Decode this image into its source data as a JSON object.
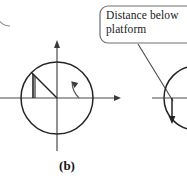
{
  "figure": {
    "background": "#ffffff",
    "stroke_color": "#3a3a3a",
    "stroke_color_dark": "#242424",
    "callout_border_color": "#6e6e6e",
    "axis_color": "#4a4a4a",
    "panel_label": "(b)",
    "callout": {
      "text": "Distance below\nplatform",
      "line1": "Distance below",
      "line2": "platform"
    },
    "left_diagram": {
      "center_x": 57,
      "center_y": 98,
      "radius": 36,
      "angle_arc_radius": 22,
      "radius_point_x": 34,
      "radius_point_y": 75,
      "x_axis_from": 0,
      "x_axis_to": 121,
      "y_axis_top": 40,
      "y_axis_bottom": 151
    },
    "right_diagram": {
      "center_x": 186,
      "center_y": 98,
      "radius": 32,
      "x_axis_from": 152,
      "x_axis_to": 187,
      "drop_line_x": 172,
      "drop_line_bottom": 124
    },
    "leader_line": {
      "x1": 138,
      "y1": 44,
      "x2": 172,
      "y2": 100
    }
  }
}
